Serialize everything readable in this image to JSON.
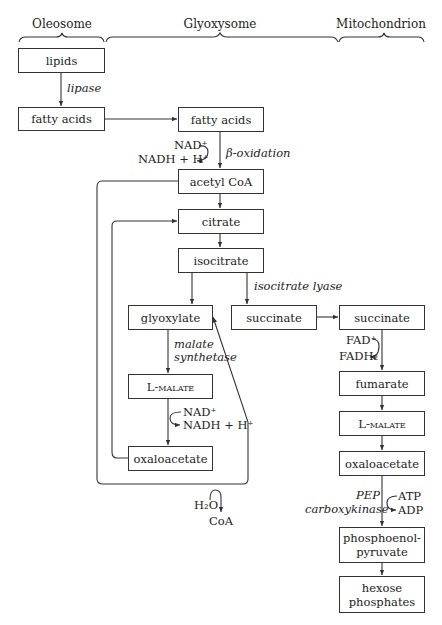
{
  "headers": {
    "oleosome": "Oleosome",
    "glyoxysome": "Glyoxysome",
    "mitochondrion": "Mitochondrion"
  },
  "nodes": {
    "lipids": "lipids",
    "fatty_acids_oleosome": "fatty acids",
    "fatty_acids_glyoxysome": "fatty acids",
    "acetyl_coa": "acetyl CoA",
    "citrate": "citrate",
    "isocitrate": "isocitrate",
    "glyoxylate": "glyoxylate",
    "succinate_glyoxysome": "succinate",
    "l_malate_glyoxysome": "L-malate",
    "oxaloacetate_glyoxysome": "oxaloacetate",
    "succinate_mito": "succinate",
    "fumarate": "fumarate",
    "l_malate_mito": "L-malate",
    "oxaloacetate_mito": "oxaloacetate",
    "pep_line1": "phosphoenol-",
    "pep_line2": "pyruvate",
    "hexose_line1": "hexose",
    "hexose_line2": "phosphates"
  },
  "enzymes": {
    "lipase": "lipase",
    "beta_oxidation": "β-oxidation",
    "isocitrate_lyase": "isocitrate lyase",
    "malate_synthetase_1": "malate",
    "malate_synthetase_2": "synthetase",
    "pep_carboxykinase_1": "PEP",
    "pep_carboxykinase_2": "carboxykinase"
  },
  "cofactors": {
    "nad_beta": "NAD⁺",
    "nadh_beta": "NADH + H⁺",
    "nad_malate": "NAD⁺",
    "nadh_malate": "NADH + H⁺",
    "fad": "FAD⁺",
    "fadh2": "FADH₂",
    "h2o": "H₂O",
    "coa": "CoA",
    "atp": "ATP",
    "adp": "ADP"
  }
}
